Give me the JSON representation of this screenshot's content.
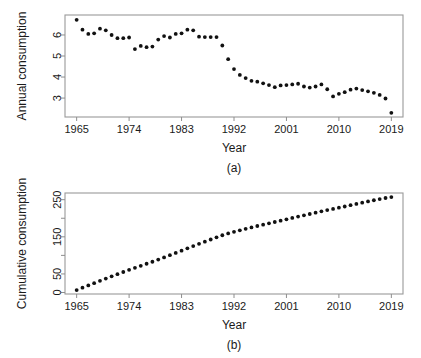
{
  "figure": {
    "caption_a": "(a)",
    "caption_b": "(b)",
    "background": "#ffffff",
    "point_color": "#111111",
    "axis_color": "#8e8e8e"
  },
  "chart_data": [
    {
      "type": "scatter",
      "id": "panel-a",
      "title": "",
      "xlabel": "Year",
      "ylabel": "Annual consumption",
      "caption": "(a)",
      "grid": false,
      "legend": "none",
      "xlim": [
        1963,
        2021
      ],
      "ylim": [
        2.1,
        6.95
      ],
      "xticks": [
        1965,
        1974,
        1983,
        1992,
        2001,
        2010,
        2019
      ],
      "xticklabels": [
        "1965",
        "1974",
        "1983",
        "1992",
        "2001",
        "2010",
        "2019"
      ],
      "yticks": [
        3,
        4,
        5,
        6
      ],
      "yticklabels": [
        "3",
        "4",
        "5",
        "6"
      ],
      "x": [
        1965,
        1966,
        1967,
        1968,
        1969,
        1970,
        1971,
        1972,
        1973,
        1974,
        1975,
        1976,
        1977,
        1978,
        1979,
        1980,
        1981,
        1982,
        1983,
        1984,
        1985,
        1986,
        1987,
        1988,
        1989,
        1990,
        1991,
        1992,
        1993,
        1994,
        1995,
        1996,
        1997,
        1998,
        1999,
        2000,
        2001,
        2002,
        2003,
        2004,
        2005,
        2006,
        2007,
        2008,
        2009,
        2010,
        2011,
        2012,
        2013,
        2014,
        2015,
        2016,
        2017,
        2018,
        2019
      ],
      "values": [
        6.72,
        6.25,
        6.05,
        6.08,
        6.3,
        6.22,
        6.0,
        5.85,
        5.85,
        5.88,
        5.33,
        5.48,
        5.42,
        5.45,
        5.78,
        5.95,
        5.88,
        6.05,
        6.08,
        6.25,
        6.22,
        5.92,
        5.9,
        5.9,
        5.9,
        5.5,
        4.85,
        4.38,
        4.1,
        3.95,
        3.82,
        3.78,
        3.7,
        3.62,
        3.52,
        3.6,
        3.62,
        3.65,
        3.68,
        3.55,
        3.5,
        3.55,
        3.65,
        3.42,
        3.08,
        3.2,
        3.28,
        3.4,
        3.45,
        3.38,
        3.32,
        3.25,
        3.15,
        2.98,
        2.3
      ]
    },
    {
      "type": "scatter",
      "id": "panel-b",
      "title": "",
      "xlabel": "Year",
      "ylabel": "Cumulative consumption",
      "caption": "(b)",
      "grid": false,
      "legend": "none",
      "xlim": [
        1963,
        2021
      ],
      "ylim": [
        -4,
        268
      ],
      "xticks": [
        1965,
        1974,
        1983,
        1992,
        2001,
        2010,
        2019
      ],
      "xticklabels": [
        "1965",
        "1974",
        "1983",
        "1992",
        "2001",
        "2010",
        "2019"
      ],
      "yticks": [
        0,
        50,
        100,
        150,
        200,
        250
      ],
      "yticklabels": [
        "0",
        "50",
        "",
        "150",
        "",
        "250"
      ],
      "x": [
        1965,
        1966,
        1967,
        1968,
        1969,
        1970,
        1971,
        1972,
        1973,
        1974,
        1975,
        1976,
        1977,
        1978,
        1979,
        1980,
        1981,
        1982,
        1983,
        1984,
        1985,
        1986,
        1987,
        1988,
        1989,
        1990,
        1991,
        1992,
        1993,
        1994,
        1995,
        1996,
        1997,
        1998,
        1999,
        2000,
        2001,
        2002,
        2003,
        2004,
        2005,
        2006,
        2007,
        2008,
        2009,
        2010,
        2011,
        2012,
        2013,
        2014,
        2015,
        2016,
        2017,
        2018,
        2019
      ],
      "values": [
        6.7,
        13.0,
        19.0,
        25.1,
        31.4,
        37.6,
        43.6,
        49.5,
        55.3,
        61.2,
        66.5,
        72.0,
        77.4,
        82.9,
        88.7,
        94.6,
        100.5,
        106.5,
        112.6,
        118.9,
        125.1,
        131.0,
        136.9,
        142.8,
        148.7,
        154.2,
        159.1,
        163.4,
        167.5,
        171.5,
        175.3,
        179.1,
        182.8,
        186.4,
        189.9,
        193.5,
        197.1,
        200.8,
        204.5,
        208.0,
        211.5,
        215.1,
        218.7,
        222.1,
        225.2,
        228.4,
        231.7,
        235.1,
        238.6,
        241.9,
        245.3,
        248.5,
        251.7,
        254.6,
        256.9
      ]
    }
  ]
}
